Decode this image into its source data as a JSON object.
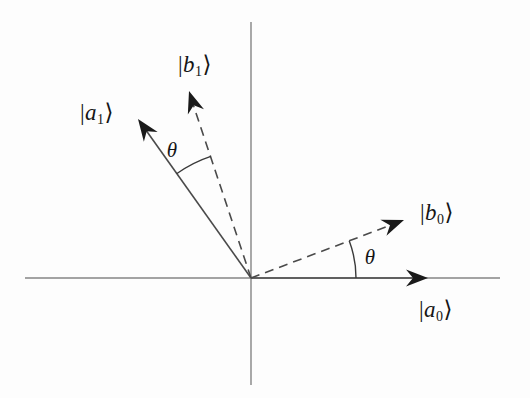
{
  "colors": {
    "axis": "#848484",
    "vector": "#4a4a4a",
    "arc": "#3a3a3a",
    "arrowhead": "#1a1a1a",
    "text": "#151515"
  },
  "labels": {
    "a0": {
      "bar": "|",
      "letter": "a",
      "sub": "0",
      "ket": "⟩"
    },
    "a1": {
      "bar": "|",
      "letter": "a",
      "sub": "1",
      "ket": "⟩"
    },
    "b0": {
      "bar": "|",
      "letter": "b",
      "sub": "0",
      "ket": "⟩"
    },
    "b1": {
      "bar": "|",
      "letter": "b",
      "sub": "1",
      "ket": "⟩"
    },
    "theta": "θ"
  },
  "diagram": {
    "type": "vector-basis-rotation",
    "vectors": [
      {
        "name": "a0",
        "label": "|a0⟩",
        "style": "solid",
        "angle_deg": 0
      },
      {
        "name": "a1",
        "label": "|a1⟩",
        "style": "solid",
        "angle_deg": 126
      },
      {
        "name": "b0",
        "label": "|b0⟩",
        "style": "dashed",
        "angle_deg": 21
      },
      {
        "name": "b1",
        "label": "|b1⟩",
        "style": "dashed",
        "angle_deg": 108
      }
    ],
    "angle_annotations": [
      {
        "symbol": "θ",
        "between": [
          "a1",
          "b1"
        ]
      },
      {
        "symbol": "θ",
        "between": [
          "x-axis",
          "b0"
        ]
      }
    ]
  }
}
